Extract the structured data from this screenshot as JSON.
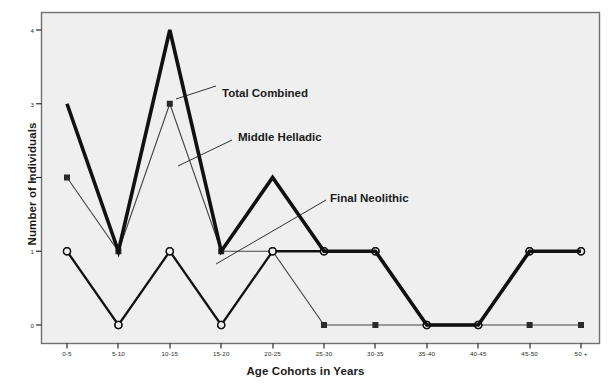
{
  "chart_data": {
    "type": "line",
    "title": "",
    "xlabel": "Age Cohorts in Years",
    "ylabel": "Number of Individuals",
    "categories": [
      "0-5",
      "5-10",
      "10-15",
      "15-20",
      "20-25",
      "25-30",
      "30-35",
      "35-40",
      "40-45",
      "45-50",
      "50 +"
    ],
    "ytick_labels": [
      "0",
      "1",
      "2",
      "3",
      "4"
    ],
    "ytick_values": [
      0,
      1,
      2,
      3,
      4
    ],
    "ylim": [
      -0.27,
      4.25
    ],
    "grid": false,
    "legend_position": "inline-annotations",
    "series": [
      {
        "name": "Total Combined",
        "marker": "none",
        "linewidth": "thick",
        "color": "#111111",
        "values": [
          3,
          1,
          4,
          1,
          2,
          1,
          1,
          0,
          0,
          1,
          1
        ]
      },
      {
        "name": "Middle Helladic",
        "marker": "filled-square",
        "linewidth": "thin",
        "color": "#444444",
        "values": [
          2,
          1,
          3,
          1,
          1,
          0,
          0,
          0,
          0,
          0,
          0
        ]
      },
      {
        "name": "Final Neolithic",
        "marker": "open-circle",
        "linewidth": "medium",
        "color": "#111111",
        "values": [
          1,
          0,
          1,
          0,
          1,
          1,
          1,
          0,
          0,
          1,
          1
        ]
      }
    ],
    "annotations": [
      {
        "text": "Total Combined",
        "x_px": 222,
        "y_px": 87
      },
      {
        "text": "Middle Helladic",
        "x_px": 238,
        "y_px": 131
      },
      {
        "text": "Final Neolithic",
        "x_px": 330,
        "y_px": 192
      }
    ]
  },
  "plot_area": {
    "background_color": "#f0f0f0",
    "border_color": "#6e6e6e"
  }
}
